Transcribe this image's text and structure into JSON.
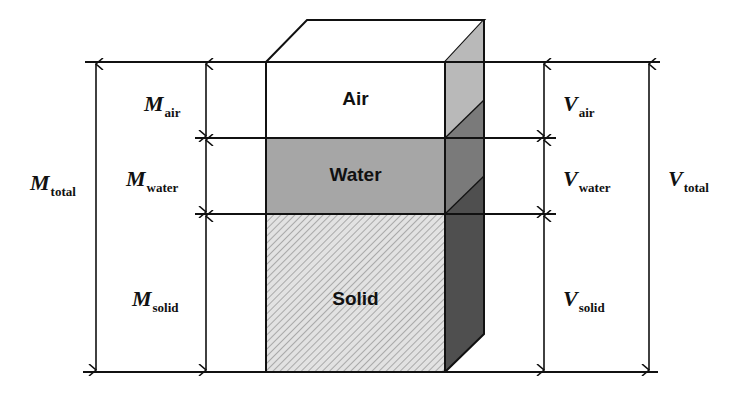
{
  "diagram": {
    "type": "soil phase diagram",
    "phases": [
      {
        "id": "air",
        "label": "Air",
        "fill": "#ffffff",
        "side_fill": "#b9b9b9"
      },
      {
        "id": "water",
        "label": "Water",
        "fill": "#a6a6a6",
        "side_fill": "#7a7a7a"
      },
      {
        "id": "solid",
        "label": "Solid",
        "fill": "#e2e2e2",
        "hatch": "#9a9a9a",
        "side_fill": "#4f4f4f"
      }
    ],
    "mass_labels": {
      "total": {
        "symbol": "M",
        "subscript": "total"
      },
      "air": {
        "symbol": "M",
        "subscript": "air"
      },
      "water": {
        "symbol": "M",
        "subscript": "water"
      },
      "solid": {
        "symbol": "M",
        "subscript": "solid"
      }
    },
    "volume_labels": {
      "total": {
        "symbol": "V",
        "subscript": "total"
      },
      "air": {
        "symbol": "V",
        "subscript": "air"
      },
      "water": {
        "symbol": "V",
        "subscript": "water"
      },
      "solid": {
        "symbol": "V",
        "subscript": "solid"
      }
    },
    "colors": {
      "line": "#111111",
      "background": "#ffffff"
    }
  }
}
